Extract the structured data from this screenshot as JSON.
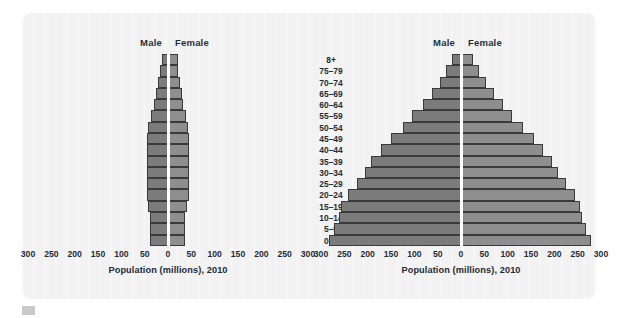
{
  "figure": {
    "panel_bg": "#f2f2f2",
    "male_color": "#7b7b7b",
    "female_color": "#8e8e8e",
    "axis_color": "#ffffff"
  },
  "age_groups": [
    "8+",
    "75–79",
    "70–74",
    "65–69",
    "60–64",
    "55–59",
    "50–54",
    "45–49",
    "40–44",
    "35–39",
    "30–34",
    "25–29",
    "20–24",
    "15–19",
    "10–14",
    "5–9",
    "0–4"
  ],
  "legend": {
    "male": "Male",
    "female": "Female"
  },
  "axis": {
    "xlabel": "Population (millions), 2010",
    "ticks": [
      "300",
      "250",
      "200",
      "150",
      "100",
      "50",
      "0",
      "50",
      "100",
      "150",
      "200",
      "250",
      "300"
    ],
    "tick_values": [
      -300,
      -250,
      -200,
      -150,
      -100,
      -50,
      0,
      50,
      100,
      150,
      200,
      250,
      300
    ],
    "xlim": [
      -300,
      300
    ]
  },
  "chart_data": [
    {
      "type": "bar",
      "name": "left-population-pyramid",
      "orientation": "horizontal",
      "pyramid": true,
      "title": "",
      "xlabel": "Population (millions), 2010",
      "ylabel": "",
      "xlim": [
        -300,
        300
      ],
      "grid": false,
      "legend": [
        "Male",
        "Female"
      ],
      "categories": [
        "8+",
        "75–79",
        "70–74",
        "65–69",
        "60–64",
        "55–59",
        "50–54",
        "45–49",
        "40–44",
        "35–39",
        "30–34",
        "25–29",
        "20–24",
        "15–19",
        "10–14",
        "5–9",
        "0–4"
      ],
      "series": [
        {
          "name": "Male",
          "values": [
            13,
            17,
            22,
            26,
            31,
            37,
            42,
            45,
            46,
            45,
            44,
            44,
            45,
            42,
            39,
            38,
            38
          ]
        },
        {
          "name": "Female",
          "values": [
            22,
            22,
            26,
            29,
            33,
            38,
            43,
            46,
            46,
            45,
            44,
            44,
            44,
            41,
            37,
            36,
            36
          ]
        }
      ]
    },
    {
      "type": "bar",
      "name": "right-population-pyramid",
      "orientation": "horizontal",
      "pyramid": true,
      "title": "",
      "xlabel": "Population (millions), 2010",
      "ylabel": "",
      "xlim": [
        -300,
        300
      ],
      "grid": false,
      "legend": [
        "Male",
        "Female"
      ],
      "categories": [
        "8+",
        "75–79",
        "70–74",
        "65–69",
        "60–64",
        "55–59",
        "50–54",
        "45–49",
        "40–44",
        "35–39",
        "30–34",
        "25–29",
        "20–24",
        "15–19",
        "10–14",
        "5–9",
        "0–4"
      ],
      "series": [
        {
          "name": "Male",
          "values": [
            20,
            32,
            46,
            62,
            82,
            104,
            125,
            150,
            172,
            192,
            205,
            222,
            243,
            258,
            262,
            272,
            283
          ]
        },
        {
          "name": "Female",
          "values": [
            25,
            38,
            54,
            70,
            90,
            110,
            132,
            156,
            176,
            194,
            208,
            224,
            244,
            256,
            260,
            268,
            278
          ]
        }
      ]
    }
  ]
}
